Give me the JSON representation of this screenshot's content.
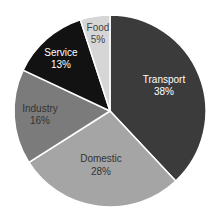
{
  "chart_data": {
    "type": "pie",
    "title": "",
    "categories": [
      "Transport",
      "Domestic",
      "Industry",
      "Service",
      "Food"
    ],
    "values": [
      38,
      28,
      16,
      13,
      5
    ],
    "labels": [
      "38%",
      "28%",
      "16%",
      "13%",
      "5%"
    ],
    "colors": [
      "#3b3b3b",
      "#a5a5a5",
      "#7b7b7b",
      "#121212",
      "#d6d6d6"
    ],
    "label_colors": [
      "#ffffff",
      "#333333",
      "#333333",
      "#ffffff",
      "#444444"
    ],
    "start_angle": "12 o'clock",
    "direction": "clockwise",
    "legend": "none"
  },
  "slices": [
    {
      "name": "Transport",
      "pct": "38%"
    },
    {
      "name": "Domestic",
      "pct": "28%"
    },
    {
      "name": "Industry",
      "pct": "16%"
    },
    {
      "name": "Service",
      "pct": "13%"
    },
    {
      "name": "Food",
      "pct": "5%"
    }
  ]
}
